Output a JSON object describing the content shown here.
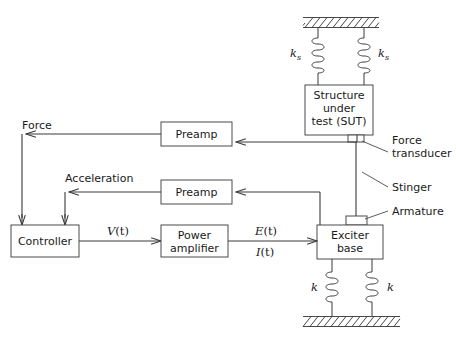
{
  "diagram": {
    "boxes": [
      {
        "id": "sut",
        "label_lines": [
          "Structure",
          "under",
          "test (SUT)"
        ]
      },
      {
        "id": "preamp_force",
        "label_lines": [
          "Preamp"
        ]
      },
      {
        "id": "preamp_accel",
        "label_lines": [
          "Preamp"
        ]
      },
      {
        "id": "controller",
        "label_lines": [
          "Controller"
        ]
      },
      {
        "id": "power_amplifier",
        "label_lines": [
          "Power",
          "amplifier"
        ]
      },
      {
        "id": "exciter_base",
        "label_lines": [
          "Exciter",
          "base"
        ]
      },
      {
        "id": "armature_block",
        "label_lines": []
      }
    ],
    "signal_labels": [
      {
        "id": "force",
        "text": "Force"
      },
      {
        "id": "acceleration",
        "text": "Acceleration"
      },
      {
        "id": "voltage",
        "text": "V(t)",
        "base": "V",
        "paren": "(t)"
      },
      {
        "id": "emf",
        "text": "E(t)",
        "base": "E",
        "paren": "(t)"
      },
      {
        "id": "current",
        "text": "I(t)",
        "base": "I",
        "paren": "(t)"
      }
    ],
    "callouts": [
      {
        "id": "force-transducer",
        "lines": [
          "Force",
          "transducer"
        ]
      },
      {
        "id": "stinger",
        "lines": [
          "Stinger"
        ]
      },
      {
        "id": "armature",
        "lines": [
          "Armature"
        ]
      }
    ],
    "stiffness_labels": [
      {
        "id": "ks-left",
        "base": "k",
        "sub": "s"
      },
      {
        "id": "ks-right",
        "base": "k",
        "sub": "s"
      },
      {
        "id": "k-left",
        "base": "k",
        "sub": ""
      },
      {
        "id": "k-right",
        "base": "k",
        "sub": ""
      }
    ],
    "colors": {
      "background": "#ffffff",
      "line": "#3a3a3a",
      "box_stroke": "#4a4a4a",
      "text": "#1a1a1a",
      "hatch": "#333333"
    }
  }
}
